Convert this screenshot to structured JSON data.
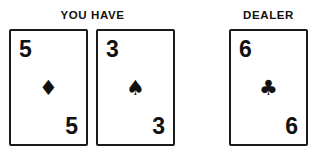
{
  "headers": {
    "player": "YOU HAVE",
    "dealer": "DEALER"
  },
  "colors": {
    "ink": "#1a1a1a",
    "card_face": "#ffffff",
    "background": "#ffffff"
  },
  "player_hand": {
    "cards": [
      {
        "rank": "5",
        "suit_name": "diamond",
        "suit_glyph": "♦",
        "rank_top": "5",
        "rank_bottom": "5"
      },
      {
        "rank": "3",
        "suit_name": "spade",
        "suit_glyph": "♠",
        "rank_top": "3",
        "rank_bottom": "3"
      }
    ]
  },
  "dealer_hand": {
    "cards": [
      {
        "rank": "6",
        "suit_name": "club",
        "suit_glyph": "♣",
        "rank_top": "6",
        "rank_bottom": "6"
      }
    ]
  }
}
